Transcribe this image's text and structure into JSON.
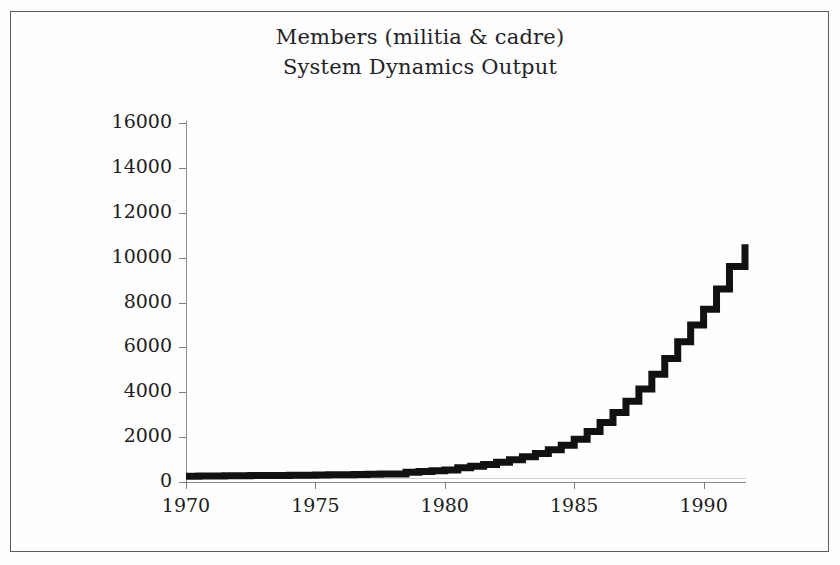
{
  "figure": {
    "title_line_1": "Members (militia & cadre)",
    "title_line_2": "System Dynamics Output",
    "frame_color": "#5a5a5e",
    "background_color": "#fefefe",
    "axis_color": "#8c8c90",
    "series_color": "#111111"
  },
  "chart_data": {
    "type": "line",
    "title": "Members (militia & cadre)\nSystem Dynamics Output",
    "subtitle": "System Dynamics Output",
    "xlabel": "",
    "ylabel": "",
    "xlim": [
      1970,
      1991.6
    ],
    "ylim": [
      0,
      16000
    ],
    "grid": false,
    "legend": "none",
    "x_ticks": [
      1970,
      1975,
      1980,
      1985,
      1990
    ],
    "x_tick_labels": [
      "1970",
      "1975",
      "1980",
      "1985",
      "1990"
    ],
    "y_ticks": [
      0,
      2000,
      4000,
      6000,
      8000,
      10000,
      12000,
      14000,
      16000
    ],
    "y_tick_labels": [
      "0",
      "2000",
      "4000",
      "6000",
      "8000",
      "10000",
      "12000",
      "14000",
      "16000"
    ],
    "series": [
      {
        "name": "Members (militia & cadre)",
        "style": "stepped-line",
        "x": [
          1970.0,
          1970.5,
          1971.0,
          1971.5,
          1972.0,
          1972.5,
          1973.0,
          1973.5,
          1974.0,
          1974.5,
          1975.0,
          1975.5,
          1976.0,
          1976.5,
          1977.0,
          1977.5,
          1978.0,
          1978.5,
          1979.0,
          1979.5,
          1980.0,
          1980.5,
          1981.0,
          1981.5,
          1982.0,
          1982.5,
          1983.0,
          1983.5,
          1984.0,
          1984.5,
          1985.0,
          1985.5,
          1986.0,
          1986.5,
          1987.0,
          1987.5,
          1988.0,
          1988.5,
          1989.0,
          1989.5,
          1990.0,
          1990.5,
          1991.0,
          1991.6
        ],
        "values": [
          260,
          265,
          270,
          275,
          280,
          285,
          290,
          295,
          300,
          305,
          310,
          318,
          326,
          334,
          342,
          352,
          362,
          430,
          470,
          500,
          540,
          640,
          700,
          780,
          880,
          990,
          1120,
          1270,
          1440,
          1640,
          1900,
          2250,
          2650,
          3100,
          3600,
          4150,
          4800,
          5500,
          6250,
          7000,
          7700,
          8600,
          9600,
          10600
        ]
      }
    ],
    "annotations": [
      {
        "text": "flat baseline near 300 members from 1970 through 1978"
      },
      {
        "text": "step increases begin around 1978 and 1980"
      },
      {
        "text": "exponential growth from 1982 to 1991 reaching about 10600"
      }
    ]
  }
}
